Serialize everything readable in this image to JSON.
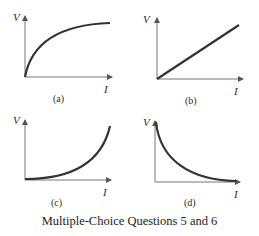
{
  "caption": "Multiple-Choice Questions 5 and 6",
  "graphs": [
    {
      "id": "a",
      "label": "(a)",
      "y_axis": "V",
      "x_axis": "I",
      "curve": "concave-down rising, saturating (logarithmic-like)"
    },
    {
      "id": "b",
      "label": "(b)",
      "y_axis": "V",
      "x_axis": "I",
      "curve": "straight line through origin (linear)"
    },
    {
      "id": "c",
      "label": "(c)",
      "y_axis": "V",
      "x_axis": "I",
      "curve": "concave-up rising (exponential-like)"
    },
    {
      "id": "d",
      "label": "(d)",
      "y_axis": "V",
      "x_axis": "I",
      "curve": "decreasing, concave-up decay (inverse/exponential decay)"
    }
  ],
  "colors": {
    "curve": "#333333",
    "axis": "#555555",
    "text": "#2a2a2a"
  }
}
